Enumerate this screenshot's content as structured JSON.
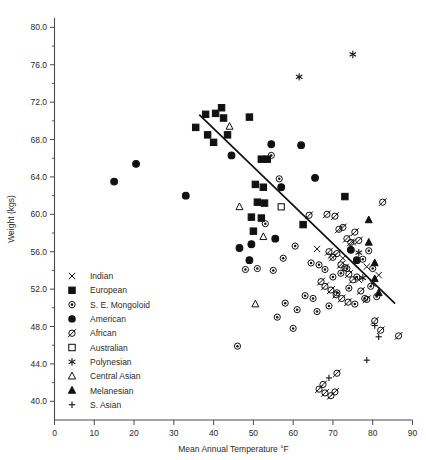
{
  "chart_data": {
    "type": "scatter",
    "title": "",
    "xlabel": "Mean Annual Temperature °F",
    "ylabel": "Weight (kgs)",
    "xlim": [
      0,
      90
    ],
    "ylim": [
      38.0,
      81.0
    ],
    "xticks": [
      0,
      10,
      20,
      30,
      40,
      50,
      60,
      70,
      80,
      90
    ],
    "xtick_labels": [
      "0",
      "10",
      "20",
      "30",
      "40",
      "50",
      "60",
      "70",
      "80",
      "90"
    ],
    "yticks": [
      40.0,
      44.0,
      48.0,
      52.0,
      56.0,
      60.0,
      64.0,
      68.0,
      72.0,
      76.0,
      80.0
    ],
    "ytick_labels": [
      "40.0",
      "44.0",
      "48.0",
      "52.0",
      "56.0",
      "60.0",
      "64.0",
      "68.0",
      "72.0",
      "76.0",
      "80.0"
    ],
    "y_minor_ticks": [
      42.0,
      46.0,
      50.0,
      54.0,
      58.0,
      62.0,
      66.0,
      70.0,
      74.0,
      78.0
    ],
    "grid": false,
    "legend_position": "inside-left-lower",
    "trendline": {
      "x0": 36.5,
      "y0": 70.6,
      "x1": 85.5,
      "y1": 50.5,
      "color": "#111111"
    },
    "series": [
      {
        "name": "Indian",
        "marker": "x-cross",
        "filled": false,
        "points": [
          [
            66.0,
            56.3
          ],
          [
            72.5,
            55.3
          ],
          [
            75.0,
            57.0
          ],
          [
            76.5,
            53.0
          ],
          [
            78.5,
            54.4
          ],
          [
            80.0,
            52.6
          ],
          [
            81.5,
            53.5
          ],
          [
            69.5,
            55.6
          ]
        ]
      },
      {
        "name": "European",
        "marker": "square",
        "filled": true,
        "points": [
          [
            35.5,
            69.3
          ],
          [
            38.0,
            70.7
          ],
          [
            40.5,
            70.8
          ],
          [
            42.0,
            71.4
          ],
          [
            42.5,
            70.3
          ],
          [
            38.5,
            68.5
          ],
          [
            40.0,
            67.7
          ],
          [
            43.5,
            68.5
          ],
          [
            49.0,
            70.4
          ],
          [
            52.0,
            65.9
          ],
          [
            53.5,
            65.9
          ],
          [
            50.5,
            63.2
          ],
          [
            52.5,
            62.9
          ],
          [
            51.0,
            61.3
          ],
          [
            52.8,
            61.2
          ],
          [
            49.5,
            59.7
          ],
          [
            52.0,
            59.6
          ],
          [
            50.0,
            58.2
          ],
          [
            62.5,
            58.9
          ],
          [
            73.0,
            61.9
          ]
        ]
      },
      {
        "name": "S. E. Mongoloid",
        "marker": "circle-dot",
        "filled": false,
        "points": [
          [
            54.5,
            66.3
          ],
          [
            56.5,
            63.8
          ],
          [
            53.0,
            59.0
          ],
          [
            46.0,
            45.9
          ],
          [
            57.5,
            55.3
          ],
          [
            60.5,
            56.6
          ],
          [
            55.0,
            54.0
          ],
          [
            51.0,
            54.2
          ],
          [
            48.0,
            54.1
          ],
          [
            64.5,
            54.8
          ],
          [
            66.5,
            54.6
          ],
          [
            68.0,
            54.1
          ],
          [
            70.0,
            53.3
          ],
          [
            72.0,
            53.7
          ],
          [
            73.5,
            54.2
          ],
          [
            63.0,
            51.3
          ],
          [
            65.0,
            51.0
          ],
          [
            71.0,
            51.6
          ],
          [
            74.0,
            52.1
          ],
          [
            76.0,
            53.3
          ],
          [
            77.5,
            55.2
          ],
          [
            79.0,
            56.1
          ],
          [
            80.0,
            54.2
          ],
          [
            79.5,
            52.3
          ],
          [
            78.0,
            51.0
          ],
          [
            58.0,
            50.5
          ],
          [
            61.0,
            49.8
          ],
          [
            56.0,
            49.0
          ],
          [
            66.0,
            49.6
          ],
          [
            69.0,
            50.2
          ],
          [
            81.0,
            51.2
          ],
          [
            75.5,
            50.4
          ],
          [
            60.0,
            47.8
          ]
        ]
      },
      {
        "name": "American",
        "marker": "circle",
        "filled": true,
        "points": [
          [
            15.0,
            63.5
          ],
          [
            20.5,
            65.4
          ],
          [
            33.0,
            62.0
          ],
          [
            44.5,
            66.3
          ],
          [
            54.5,
            67.5
          ],
          [
            62.0,
            67.4
          ],
          [
            57.0,
            62.9
          ],
          [
            49.5,
            56.8
          ],
          [
            49.0,
            55.1
          ],
          [
            46.5,
            56.4
          ],
          [
            55.5,
            57.4
          ],
          [
            65.5,
            63.9
          ],
          [
            74.5,
            56.2
          ],
          [
            76.0,
            55.1
          ]
        ]
      },
      {
        "name": "African",
        "marker": "circle-slash",
        "filled": false,
        "points": [
          [
            68.5,
            60.0
          ],
          [
            70.5,
            59.8
          ],
          [
            71.5,
            58.4
          ],
          [
            72.5,
            58.6
          ],
          [
            73.5,
            57.4
          ],
          [
            74.5,
            57.0
          ],
          [
            75.5,
            58.1
          ],
          [
            76.5,
            57.2
          ],
          [
            69.0,
            56.0
          ],
          [
            70.0,
            55.4
          ],
          [
            71.0,
            55.8
          ],
          [
            72.0,
            54.6
          ],
          [
            73.0,
            54.3
          ],
          [
            74.0,
            53.6
          ],
          [
            75.0,
            53.0
          ],
          [
            67.0,
            52.8
          ],
          [
            68.0,
            52.3
          ],
          [
            69.5,
            51.9
          ],
          [
            70.8,
            51.4
          ],
          [
            72.2,
            51.0
          ],
          [
            73.8,
            50.6
          ],
          [
            77.0,
            51.8
          ],
          [
            78.5,
            50.9
          ],
          [
            80.5,
            48.6
          ],
          [
            82.0,
            47.6
          ],
          [
            66.5,
            41.3
          ],
          [
            68.0,
            40.9
          ],
          [
            69.5,
            40.6
          ],
          [
            70.5,
            41.0
          ],
          [
            71.0,
            43.0
          ],
          [
            67.5,
            41.8
          ],
          [
            82.5,
            61.3
          ],
          [
            64.0,
            59.9
          ],
          [
            86.5,
            47.0
          ]
        ]
      },
      {
        "name": "Australian",
        "marker": "square",
        "filled": false,
        "points": [
          [
            57.0,
            60.8
          ]
        ]
      },
      {
        "name": "Polynesian",
        "marker": "asterisk",
        "filled": false,
        "points": [
          [
            61.5,
            74.7
          ],
          [
            75.0,
            77.1
          ],
          [
            76.5,
            55.9
          ],
          [
            77.5,
            53.2
          ]
        ]
      },
      {
        "name": "Central Asian",
        "marker": "triangle",
        "filled": false,
        "points": [
          [
            44.0,
            69.4
          ],
          [
            46.5,
            60.8
          ],
          [
            52.5,
            57.6
          ],
          [
            50.5,
            50.4
          ]
        ]
      },
      {
        "name": "Melanesian",
        "marker": "triangle",
        "filled": true,
        "points": [
          [
            79.0,
            59.4
          ],
          [
            79.0,
            57.0
          ],
          [
            80.5,
            54.8
          ],
          [
            80.5,
            53.1
          ],
          [
            81.5,
            51.6
          ]
        ]
      },
      {
        "name": "S. Asian",
        "marker": "plus",
        "filled": false,
        "points": [
          [
            80.5,
            48.1
          ],
          [
            78.5,
            44.4
          ],
          [
            81.5,
            46.9
          ],
          [
            69.0,
            42.5
          ]
        ]
      }
    ],
    "legend": [
      {
        "label": "Indian",
        "marker": "x-cross",
        "filled": false
      },
      {
        "label": "European",
        "marker": "square",
        "filled": true
      },
      {
        "label": "S. E. Mongoloid",
        "marker": "circle-dot",
        "filled": false
      },
      {
        "label": "American",
        "marker": "circle",
        "filled": true
      },
      {
        "label": "African",
        "marker": "circle-slash",
        "filled": false
      },
      {
        "label": "Australian",
        "marker": "square",
        "filled": false
      },
      {
        "label": "Polynesian",
        "marker": "asterisk",
        "filled": false
      },
      {
        "label": "Central Asian",
        "marker": "triangle",
        "filled": false
      },
      {
        "label": "Melanesian",
        "marker": "triangle",
        "filled": true
      },
      {
        "label": "S. Asian",
        "marker": "plus",
        "filled": false
      }
    ]
  }
}
